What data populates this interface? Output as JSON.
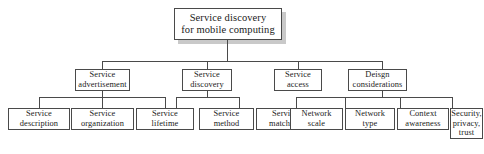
{
  "diagram": {
    "type": "tree",
    "root": {
      "label": "Service discovery\nfor mobile computing"
    },
    "level2": [
      {
        "label": "Service\nadvertisement"
      },
      {
        "label": "Service\ndiscovery"
      },
      {
        "label": "Service\naccess"
      },
      {
        "label": "Deisgn\nconsiderations"
      }
    ],
    "leaves": [
      {
        "label": "Service\ndescription"
      },
      {
        "label": "Service\norganization"
      },
      {
        "label": "Service\nlifetime"
      },
      {
        "label": "Service\nmethod"
      },
      {
        "label": "Service\nmatching"
      },
      {
        "label": "Network\nscale"
      },
      {
        "label": "Network\ntype"
      },
      {
        "label": "Context\nawareness"
      },
      {
        "label": "Security,\nprivacy,\ntrust"
      }
    ],
    "colors": {
      "border": "#4a4a4a",
      "text": "#1a1a1a",
      "background": "#ffffff",
      "shadow": "#c9c9c9"
    }
  }
}
